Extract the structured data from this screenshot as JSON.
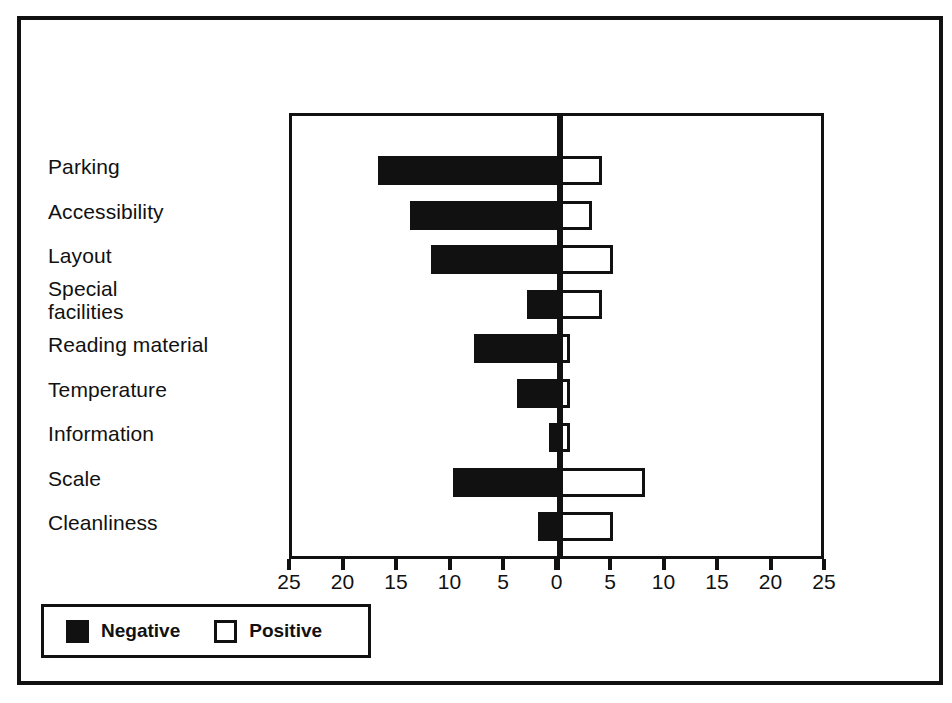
{
  "chart_data": {
    "type": "bar",
    "subtype": "diverging-horizontal-tornado",
    "title": "",
    "xlabel": "",
    "ylabel": "",
    "grid": false,
    "legend_position": "bottom-left",
    "axis": {
      "tick_values": [
        -25,
        -20,
        -15,
        -10,
        -5,
        0,
        5,
        10,
        15,
        20,
        25
      ],
      "tick_labels": [
        "25",
        "20",
        "15",
        "10",
        "5",
        "0",
        "5",
        "10",
        "15",
        "20",
        "25"
      ],
      "xlim": [
        -25,
        25
      ]
    },
    "categories": [
      "Parking",
      "Accessibility",
      "Layout",
      "Special\nfacilities",
      "Reading material",
      "Temperature",
      "Information",
      "Scale",
      "Cleanliness"
    ],
    "series": [
      {
        "name": "Negative",
        "color": "#111111",
        "style": "filled",
        "values": [
          17,
          14,
          12,
          3,
          8,
          4,
          1,
          10,
          2
        ]
      },
      {
        "name": "Positive",
        "color": "#ffffff",
        "style": "hollow",
        "values": [
          4,
          3,
          5,
          4,
          1,
          1,
          1,
          8,
          5
        ]
      }
    ],
    "negative_value_labels": [
      "17",
      "14",
      "12",
      "3",
      "8",
      "4",
      "1",
      "10",
      "2"
    ],
    "positive_value_labels": [
      "4",
      "3",
      "5",
      "4",
      "1",
      "1",
      "1",
      "8",
      "5"
    ]
  },
  "legend": {
    "entries": [
      {
        "label": "Negative",
        "swatch": "filled-square-icon"
      },
      {
        "label": "Positive",
        "swatch": "hollow-square-icon"
      }
    ]
  }
}
